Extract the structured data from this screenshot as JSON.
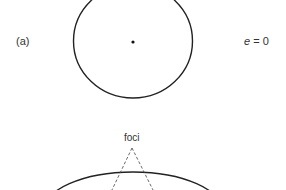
{
  "figure": {
    "panel_a": {
      "label": "(a)",
      "eccentricity_symbol": "e",
      "eccentricity_eq": " = 0",
      "shape": "circle"
    },
    "panel_b": {
      "foci_label": "foci",
      "shape": "ellipse"
    },
    "colors": {
      "stroke": "#222222",
      "text": "#333333"
    }
  }
}
